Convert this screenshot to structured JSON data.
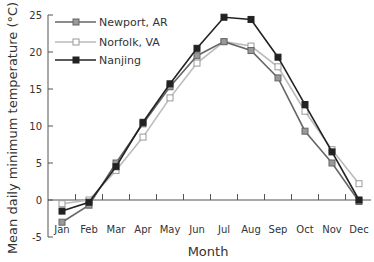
{
  "chart_data": {
    "type": "line",
    "title": "",
    "xlabel": "Month",
    "ylabel": "Mean daily minimum temperature (°C)",
    "ylim": [
      -5,
      25
    ],
    "yticks": [
      -5,
      0,
      5,
      10,
      15,
      20,
      25
    ],
    "grid": false,
    "legend_position": "upper left",
    "categories": [
      "Jan",
      "Feb",
      "Mar",
      "Apr",
      "May",
      "Jun",
      "Jul",
      "Aug",
      "Sep",
      "Oct",
      "Nov",
      "Dec"
    ],
    "series": [
      {
        "name": "Newport, AR",
        "color": "#666666",
        "marker": "square-gray",
        "values": [
          -3.0,
          -0.7,
          5.0,
          10.3,
          15.3,
          19.5,
          21.4,
          20.2,
          16.5,
          9.3,
          5.0,
          -0.2
        ]
      },
      {
        "name": "Norfolk, VA",
        "color": "#bbbbbb",
        "marker": "square-open",
        "values": [
          -0.5,
          0.0,
          4.0,
          8.5,
          13.8,
          18.5,
          21.4,
          20.8,
          18.0,
          12.0,
          6.8,
          2.2
        ]
      },
      {
        "name": "Nanjing",
        "color": "#222222",
        "marker": "square-filled",
        "values": [
          -1.5,
          -0.3,
          4.5,
          10.5,
          15.7,
          20.5,
          24.7,
          24.4,
          19.3,
          12.9,
          6.5,
          0.0
        ]
      }
    ]
  }
}
